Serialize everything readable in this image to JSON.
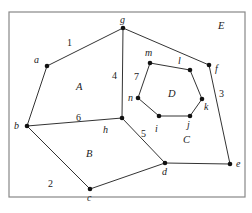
{
  "diagram": {
    "type": "planar-graph",
    "frame": {
      "x": 9,
      "y": 12,
      "width": 236,
      "height": 185,
      "stroke": "#888888"
    },
    "edge_color": "#333333",
    "vertex_color": "#111111",
    "vertices": {
      "a": {
        "x": 47,
        "y": 66,
        "label": "a",
        "lx": 34,
        "ly": 63
      },
      "b": {
        "x": 27,
        "y": 126,
        "label": "b",
        "lx": 14,
        "ly": 129
      },
      "c": {
        "x": 90,
        "y": 189,
        "label": "c",
        "lx": 87,
        "ly": 201
      },
      "d": {
        "x": 165,
        "y": 163,
        "label": "d",
        "lx": 162,
        "ly": 175
      },
      "e": {
        "x": 230,
        "y": 164,
        "label": "e",
        "lx": 236,
        "ly": 167
      },
      "f": {
        "x": 209,
        "y": 65,
        "label": "f",
        "lx": 215,
        "ly": 72
      },
      "g": {
        "x": 123,
        "y": 28,
        "label": "g",
        "lx": 120,
        "ly": 23
      },
      "h": {
        "x": 122,
        "y": 118,
        "label": "h",
        "lx": 103,
        "ly": 133
      },
      "i": {
        "x": 159,
        "y": 116,
        "label": "i",
        "lx": 155,
        "ly": 132
      },
      "j": {
        "x": 190,
        "y": 116,
        "label": "j",
        "lx": 187,
        "ly": 128
      },
      "k": {
        "x": 202,
        "y": 99,
        "label": "k",
        "lx": 204,
        "ly": 110
      },
      "l": {
        "x": 190,
        "y": 70,
        "label": "l",
        "lx": 178,
        "ly": 64
      },
      "m": {
        "x": 150,
        "y": 63,
        "label": "m",
        "lx": 145,
        "ly": 56
      },
      "n": {
        "x": 138,
        "y": 98,
        "label": "n",
        "lx": 128,
        "ly": 101
      }
    },
    "edges": [
      [
        "a",
        "g"
      ],
      [
        "a",
        "b"
      ],
      [
        "b",
        "h"
      ],
      [
        "b",
        "c"
      ],
      [
        "c",
        "d"
      ],
      [
        "g",
        "h"
      ],
      [
        "h",
        "d"
      ],
      [
        "g",
        "f"
      ],
      [
        "f",
        "e"
      ],
      [
        "d",
        "e"
      ],
      [
        "m",
        "l"
      ],
      [
        "l",
        "k"
      ],
      [
        "k",
        "j"
      ],
      [
        "j",
        "i"
      ],
      [
        "i",
        "n"
      ],
      [
        "n",
        "m"
      ]
    ],
    "edge_labels": [
      {
        "text": "1",
        "x": 67,
        "y": 46
      },
      {
        "text": "2",
        "x": 48,
        "y": 187
      },
      {
        "text": "3",
        "x": 219,
        "y": 97
      },
      {
        "text": "4",
        "x": 112,
        "y": 79
      },
      {
        "text": "5",
        "x": 141,
        "y": 137
      },
      {
        "text": "6",
        "x": 76,
        "y": 121
      },
      {
        "text": "7",
        "x": 134,
        "y": 80
      }
    ],
    "face_labels": [
      {
        "text": "A",
        "x": 76,
        "y": 90
      },
      {
        "text": "B",
        "x": 86,
        "y": 157
      },
      {
        "text": "C",
        "x": 183,
        "y": 143
      },
      {
        "text": "D",
        "x": 168,
        "y": 97
      },
      {
        "text": "E",
        "x": 218,
        "y": 29
      }
    ]
  }
}
